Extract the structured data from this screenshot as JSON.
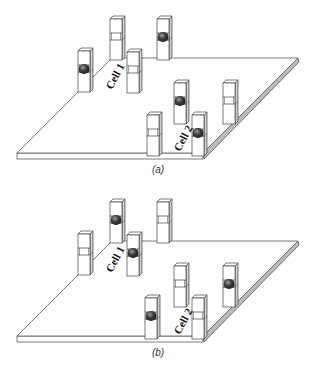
{
  "figure": {
    "panels": [
      {
        "id": "a",
        "caption": "(a)",
        "offset_y": 0,
        "cell_labels": [
          {
            "text": "Cell 1",
            "x": 112,
            "y": 90,
            "rotate": -62
          },
          {
            "text": "Cell 2",
            "x": 180,
            "y": 152,
            "rotate": -62
          }
        ],
        "pillars": [
          {
            "id": "p1",
            "x": 78,
            "y": 48,
            "filled": true
          },
          {
            "id": "p2",
            "x": 110,
            "y": 16,
            "filled": false
          },
          {
            "id": "p3",
            "x": 127,
            "y": 49,
            "filled": false
          },
          {
            "id": "p4",
            "x": 157,
            "y": 16,
            "filled": true
          },
          {
            "id": "p5",
            "x": 174,
            "y": 80,
            "filled": true
          },
          {
            "id": "p6",
            "x": 223,
            "y": 80,
            "filled": false
          },
          {
            "id": "p7",
            "x": 147,
            "y": 112,
            "filled": false
          },
          {
            "id": "p8",
            "x": 192,
            "y": 112,
            "filled": true
          }
        ]
      },
      {
        "id": "b",
        "caption": "(b)",
        "offset_y": 183,
        "cell_labels": [
          {
            "text": "Cell 1",
            "x": 112,
            "y": 90,
            "rotate": -62
          },
          {
            "text": "Cell 2",
            "x": 180,
            "y": 152,
            "rotate": -62
          }
        ],
        "pillars": [
          {
            "id": "p1",
            "x": 78,
            "y": 48,
            "filled": false
          },
          {
            "id": "p2",
            "x": 110,
            "y": 16,
            "filled": true
          },
          {
            "id": "p3",
            "x": 127,
            "y": 49,
            "filled": true
          },
          {
            "id": "p4",
            "x": 157,
            "y": 16,
            "filled": false
          },
          {
            "id": "p5",
            "x": 174,
            "y": 80,
            "filled": false
          },
          {
            "id": "p6",
            "x": 223,
            "y": 80,
            "filled": true
          },
          {
            "id": "p7",
            "x": 145,
            "y": 112,
            "filled": true
          },
          {
            "id": "p8",
            "x": 192,
            "y": 112,
            "filled": false
          }
        ]
      }
    ],
    "colors": {
      "line": "#444444",
      "slab_side": "#bbbbbb",
      "pillar_side": "#cccccc",
      "particle": "#333333"
    }
  }
}
